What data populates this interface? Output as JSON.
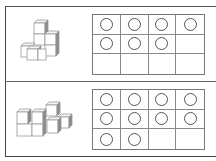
{
  "colors": {
    "frame": "#555555",
    "grid_line": "#888888",
    "counter_stroke": "#555555",
    "cube_face": "#ffffff",
    "cube_side": "#8a8a8a",
    "cube_edge": "#9a9a9a"
  },
  "problems": [
    {
      "id": "problem-1",
      "cube_count": 7,
      "ten_frame": {
        "rows": 3,
        "cols": 4,
        "filled": 7,
        "cells": [
          1,
          1,
          1,
          1,
          1,
          1,
          1,
          0,
          0,
          0,
          0,
          0
        ]
      }
    },
    {
      "id": "problem-2",
      "cube_count": 10,
      "ten_frame": {
        "rows": 3,
        "cols": 4,
        "filled": 10,
        "cells": [
          1,
          1,
          1,
          1,
          1,
          1,
          1,
          1,
          1,
          1,
          0,
          0
        ]
      }
    }
  ]
}
